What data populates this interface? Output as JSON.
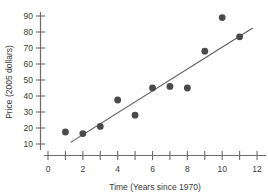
{
  "chart_data": {
    "type": "scatter",
    "title": "",
    "xlabel": "Time (Years since 1970)",
    "ylabel": "Price (2005 dollars)",
    "xlim": [
      0,
      12.4
    ],
    "ylim": [
      5,
      94
    ],
    "grid": false,
    "legend": "none",
    "x_major_ticks": [
      0,
      2,
      4,
      6,
      8,
      10,
      12
    ],
    "x_minor_ticks": [
      1,
      3,
      5,
      7,
      9,
      11
    ],
    "x_tick_labels": [
      "0",
      "2",
      "4",
      "6",
      "8",
      "10",
      "12"
    ],
    "y_ticks": [
      10,
      20,
      30,
      40,
      50,
      60,
      70,
      80,
      90
    ],
    "y_tick_labels": [
      "10",
      "20",
      "30",
      "40",
      "50",
      "60",
      "70",
      "80",
      "90"
    ],
    "x": [
      1,
      2,
      3,
      4,
      5,
      6,
      7,
      8,
      9,
      10,
      11
    ],
    "y": [
      17.5,
      16.5,
      21,
      37.5,
      28,
      45,
      46,
      45,
      68,
      89,
      77
    ],
    "points": [
      {
        "x": 1,
        "y": 17.5
      },
      {
        "x": 2,
        "y": 16.5
      },
      {
        "x": 3,
        "y": 21
      },
      {
        "x": 4,
        "y": 37.5
      },
      {
        "x": 5,
        "y": 28
      },
      {
        "x": 6,
        "y": 45
      },
      {
        "x": 7,
        "y": 46
      },
      {
        "x": 8,
        "y": 45
      },
      {
        "x": 9,
        "y": 68
      },
      {
        "x": 10,
        "y": 89
      },
      {
        "x": 11,
        "y": 77
      }
    ],
    "marker": {
      "shape": "circle",
      "size": 3.4,
      "color": "#4a4a4a"
    },
    "trendline": {
      "type": "linear-fit",
      "x_start": 1.3,
      "y_start": 11,
      "x_end": 11.75,
      "y_end": 82.5,
      "color": "#5a5a5a"
    },
    "axis_color": "#6b6b6b",
    "background": "#ffffff"
  }
}
